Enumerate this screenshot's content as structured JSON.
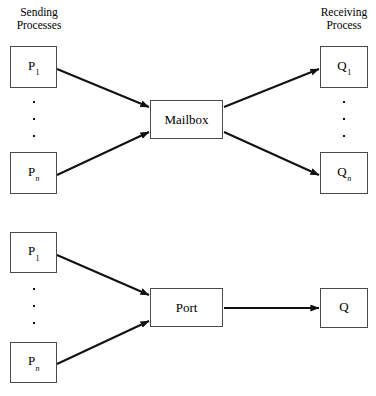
{
  "figure": {
    "type": "diagram",
    "width": 376,
    "height": 396,
    "background_color": "#ffffff",
    "line_color": "#111111",
    "box_border_color": "#4a4a4a"
  },
  "captions": {
    "sending": "Sending\nProcesses",
    "receiving": "Receiving\nProcess"
  },
  "diagrams": [
    {
      "id": "mailbox-diagram",
      "hub_label": "Mailbox",
      "senders": [
        {
          "id": "p1",
          "base": "P",
          "sub": "1",
          "sub_italic": false
        },
        {
          "id": "pn",
          "base": "P",
          "sub": "n",
          "sub_italic": true
        }
      ],
      "receivers": [
        {
          "id": "q1",
          "base": "Q",
          "sub": "1",
          "sub_italic": false
        },
        {
          "id": "qn",
          "base": "Q",
          "sub": "n",
          "sub_italic": true
        }
      ]
    },
    {
      "id": "port-diagram",
      "hub_label": "Port",
      "senders": [
        {
          "id": "p1b",
          "base": "P",
          "sub": "1",
          "sub_italic": false
        },
        {
          "id": "pnb",
          "base": "P",
          "sub": "n",
          "sub_italic": true
        }
      ],
      "receivers": [
        {
          "id": "q",
          "base": "Q",
          "sub": "",
          "sub_italic": false
        }
      ]
    }
  ],
  "boxes": {
    "top_p1": {
      "x": 10,
      "y": 46,
      "w": 47,
      "h": 42
    },
    "top_pn": {
      "x": 10,
      "y": 152,
      "w": 47,
      "h": 42
    },
    "mailbox": {
      "x": 150,
      "y": 100,
      "w": 73,
      "h": 39
    },
    "top_q1": {
      "x": 320,
      "y": 46,
      "w": 48,
      "h": 42
    },
    "top_qn": {
      "x": 320,
      "y": 152,
      "w": 48,
      "h": 42
    },
    "bot_p1": {
      "x": 10,
      "y": 232,
      "w": 47,
      "h": 41
    },
    "bot_pn": {
      "x": 10,
      "y": 342,
      "w": 47,
      "h": 41
    },
    "port": {
      "x": 150,
      "y": 288,
      "w": 73,
      "h": 39
    },
    "bot_q": {
      "x": 320,
      "y": 288,
      "w": 48,
      "h": 40
    }
  }
}
